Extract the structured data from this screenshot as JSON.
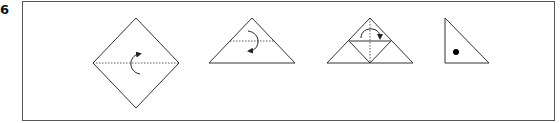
{
  "step": {
    "number": "6"
  },
  "colors": {
    "line": "#333333",
    "frame": "#555555",
    "dot": "#000000"
  },
  "diagram": {
    "frame": {
      "x": 22,
      "y": 1,
      "width": 533,
      "height": 120
    },
    "figures": [
      {
        "name": "diamond-with-horizontal-fold",
        "arrow": "fold-up"
      },
      {
        "name": "triangle-with-fold-line",
        "arrow": "fold-down"
      },
      {
        "name": "triangle-with-inner-folds",
        "arrow": "fold-over"
      },
      {
        "name": "right-triangle-result",
        "marker": "dot"
      }
    ]
  }
}
